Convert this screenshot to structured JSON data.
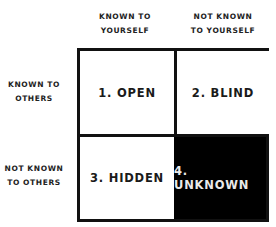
{
  "columns": [
    {
      "line1": "KNOWN TO",
      "line2": "YOURSELF"
    },
    {
      "line1": "NOT KNOWN",
      "line2": "TO YOURSELF"
    }
  ],
  "rows": [
    {
      "line1": "KNOWN TO",
      "line2": "OTHERS"
    },
    {
      "line1": "NOT KNOWN",
      "line2": "TO OTHERS"
    }
  ],
  "quadrants": [
    {
      "label": "1. OPEN",
      "fill": "#ffffff"
    },
    {
      "label": "2. BLIND",
      "fill": "#ffffff"
    },
    {
      "label": "3. HIDDEN",
      "fill": "#ffffff"
    },
    {
      "label": "4. UNKNOWN",
      "fill": "#000000"
    }
  ]
}
